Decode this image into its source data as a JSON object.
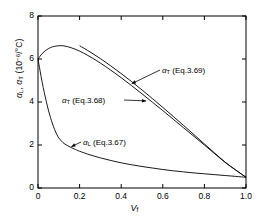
{
  "chart_data": {
    "type": "line",
    "title": "",
    "xlabel": "V_f",
    "xlabel_main": "V",
    "xlabel_sub": "f",
    "ylabel": "α_L, α_T (10^-6/°C)",
    "ylabel_parts": {
      "alpha1": "α",
      "sub1": "L",
      "sep": ", ",
      "alpha2": "α",
      "sub2": "T",
      "units_open": " (10",
      "units_exp": "−6",
      "units_close": "/°C)"
    },
    "xlim": [
      0,
      1.0
    ],
    "ylim": [
      0,
      8
    ],
    "xticks": [
      0,
      0.2,
      0.4,
      0.6,
      0.8,
      1.0
    ],
    "xticklabels": [
      "0",
      "0.2",
      "0.4",
      "0.6",
      "0.8",
      "1.0"
    ],
    "yticks": [
      0,
      2,
      4,
      6,
      8
    ],
    "yticklabels": [
      "0",
      "2",
      "4",
      "6",
      "8"
    ],
    "grid": false,
    "legend": "none",
    "tick_direction": "in",
    "frame": "box",
    "series": [
      {
        "name": "α_T (Eq.3.69)",
        "label_alpha": "α",
        "label_sub": "T",
        "label_eq": " (Eq.3.69)",
        "color": "#000000",
        "points": [
          [
            0.2,
            6.62
          ],
          [
            0.25,
            6.33
          ],
          [
            0.3,
            6.02
          ],
          [
            0.35,
            5.68
          ],
          [
            0.4,
            5.32
          ],
          [
            0.45,
            4.95
          ],
          [
            0.5,
            4.56
          ],
          [
            0.55,
            4.16
          ],
          [
            0.6,
            3.75
          ],
          [
            0.65,
            3.33
          ],
          [
            0.7,
            2.91
          ],
          [
            0.75,
            2.48
          ],
          [
            0.8,
            2.05
          ],
          [
            0.85,
            1.62
          ],
          [
            0.9,
            1.2
          ],
          [
            0.95,
            0.84
          ],
          [
            1.0,
            0.5
          ]
        ]
      },
      {
        "name": "α_T (Eq.3.68)",
        "label_alpha": "α",
        "label_sub": "T",
        "label_eq": " (Eq.3.68)",
        "color": "#000000",
        "points": [
          [
            0.0,
            6.0
          ],
          [
            0.02,
            6.25
          ],
          [
            0.04,
            6.42
          ],
          [
            0.06,
            6.53
          ],
          [
            0.08,
            6.59
          ],
          [
            0.11,
            6.62
          ],
          [
            0.14,
            6.58
          ],
          [
            0.18,
            6.45
          ],
          [
            0.22,
            6.27
          ],
          [
            0.26,
            6.05
          ],
          [
            0.3,
            5.81
          ],
          [
            0.35,
            5.48
          ],
          [
            0.4,
            5.13
          ],
          [
            0.45,
            4.76
          ],
          [
            0.5,
            4.38
          ],
          [
            0.55,
            3.99
          ],
          [
            0.6,
            3.6
          ],
          [
            0.65,
            3.2
          ],
          [
            0.7,
            2.8
          ],
          [
            0.75,
            2.4
          ],
          [
            0.8,
            2.0
          ],
          [
            0.85,
            1.59
          ],
          [
            0.9,
            1.19
          ],
          [
            0.95,
            0.84
          ],
          [
            1.0,
            0.5
          ]
        ]
      },
      {
        "name": "α_L (Eq.3.67)",
        "label_alpha": "α",
        "label_sub": "L",
        "label_eq": " (Eq.3.67)",
        "color": "#000000",
        "points": [
          [
            0.0,
            6.0
          ],
          [
            0.01,
            5.45
          ],
          [
            0.02,
            4.92
          ],
          [
            0.03,
            4.45
          ],
          [
            0.04,
            4.02
          ],
          [
            0.05,
            3.62
          ],
          [
            0.06,
            3.28
          ],
          [
            0.07,
            2.98
          ],
          [
            0.08,
            2.72
          ],
          [
            0.09,
            2.5
          ],
          [
            0.1,
            2.33
          ],
          [
            0.12,
            2.11
          ],
          [
            0.14,
            1.98
          ],
          [
            0.16,
            1.88
          ],
          [
            0.18,
            1.79
          ],
          [
            0.2,
            1.71
          ],
          [
            0.25,
            1.54
          ],
          [
            0.3,
            1.4
          ],
          [
            0.35,
            1.28
          ],
          [
            0.4,
            1.17
          ],
          [
            0.45,
            1.08
          ],
          [
            0.5,
            1.0
          ],
          [
            0.55,
            0.93
          ],
          [
            0.6,
            0.86
          ],
          [
            0.65,
            0.8
          ],
          [
            0.7,
            0.75
          ],
          [
            0.75,
            0.7
          ],
          [
            0.8,
            0.66
          ],
          [
            0.85,
            0.62
          ],
          [
            0.9,
            0.58
          ],
          [
            0.95,
            0.54
          ],
          [
            1.0,
            0.5
          ]
        ]
      }
    ],
    "annotations": [
      {
        "id": "ann-eq369",
        "text": "α_T (Eq.3.69)",
        "alpha": "α",
        "sub": "T",
        "eq": " (Eq.3.69)",
        "arrow": "left",
        "target": [
          0.45,
          4.85
        ]
      },
      {
        "id": "ann-eq368",
        "text": "α_T (Eq.3.68)",
        "alpha": "α",
        "sub": "T",
        "eq": " (Eq.3.68)",
        "arrow": "right",
        "target": [
          0.52,
          4.05
        ]
      },
      {
        "id": "ann-eq367",
        "text": "α_L (Eq.3.67)",
        "alpha": "α",
        "sub": "L",
        "eq": " (Eq.3.67)",
        "arrow": "left",
        "target": [
          0.16,
          1.92
        ]
      }
    ]
  }
}
